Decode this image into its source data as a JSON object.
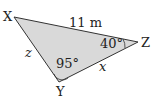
{
  "figure": {
    "type": "triangle",
    "vertices": {
      "X": {
        "label": "X"
      },
      "Y": {
        "label": "Y"
      },
      "Z": {
        "label": "Z"
      }
    },
    "sides": {
      "XZ": {
        "label": "11 m"
      },
      "XY": {
        "label": "z"
      },
      "YZ": {
        "label": "x"
      }
    },
    "angles": {
      "Y": {
        "label": "95°"
      },
      "Z": {
        "label": "40°"
      }
    },
    "fill_color": "#d9d9d9",
    "stroke_color": "#333333"
  }
}
